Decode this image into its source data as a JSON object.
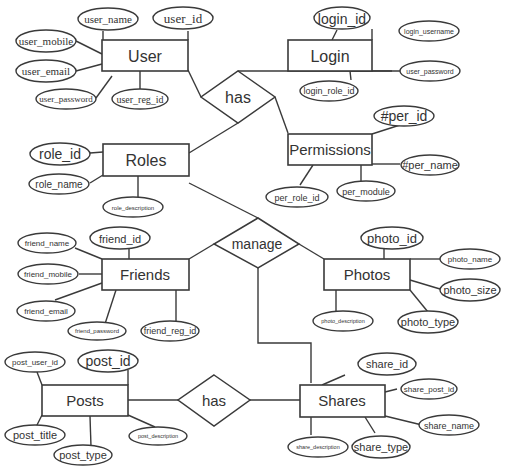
{
  "diagram": {
    "type": "entity-relationship",
    "background": "#ffffff",
    "line_color": "#3a3a3a",
    "text_color": "#333333"
  },
  "entities": {
    "user": {
      "label": "User",
      "attributes": [
        "user_name",
        "user_id",
        "user_mobile",
        "user_email",
        "user_password",
        "user_reg_id"
      ]
    },
    "login": {
      "label": "Login",
      "attributes": [
        "login_id",
        "login_username",
        "user_password",
        "login_role_id"
      ]
    },
    "permissions": {
      "label": "Permissions",
      "attributes": [
        "#per_id",
        "#per_name",
        "per_role_id",
        "per_module"
      ]
    },
    "roles": {
      "label": "Roles",
      "attributes": [
        "role_id",
        "role_name",
        "role_description"
      ]
    },
    "friends": {
      "label": "Friends",
      "attributes": [
        "friend_name",
        "friend_id",
        "friend_mobile",
        "friend_email",
        "friend_password",
        "friend_reg_id"
      ]
    },
    "photos": {
      "label": "Photos",
      "attributes": [
        "photo_id",
        "photo_name",
        "photo_size",
        "photo_type",
        "photo_description"
      ]
    },
    "posts": {
      "label": "Posts",
      "attributes": [
        "post_user_id",
        "post_id",
        "post_title",
        "post_type",
        "post_description"
      ]
    },
    "shares": {
      "label": "Shares",
      "attributes": [
        "share_id",
        "share_post_id",
        "share_name",
        "share_type",
        "share_description"
      ]
    }
  },
  "relationships": {
    "has_top": {
      "label": "has",
      "connects": [
        "User",
        "Login",
        "Roles",
        "Permissions"
      ]
    },
    "manage": {
      "label": "manage",
      "connects": [
        "Roles",
        "Friends",
        "Photos",
        "Shares"
      ]
    },
    "has_bottom": {
      "label": "has",
      "connects": [
        "Posts",
        "Shares"
      ]
    }
  }
}
